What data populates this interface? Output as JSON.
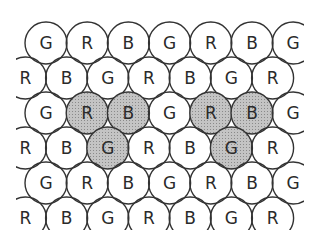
{
  "diagram": {
    "fill_plain": "#ffffff",
    "fill_highlight": "#b8b8b8",
    "stroke": "#333333",
    "rows": [
      {
        "offset": 0,
        "cells": [
          {
            "label": "G"
          },
          {
            "label": "R"
          },
          {
            "label": "B"
          },
          {
            "label": "G"
          },
          {
            "label": "R"
          },
          {
            "label": "B"
          },
          {
            "label": "G"
          }
        ]
      },
      {
        "offset": 1,
        "cells": [
          {
            "label": "R"
          },
          {
            "label": "B"
          },
          {
            "label": "G"
          },
          {
            "label": "R"
          },
          {
            "label": "B"
          },
          {
            "label": "G"
          },
          {
            "label": "R"
          }
        ]
      },
      {
        "offset": 0,
        "cells": [
          {
            "label": "G"
          },
          {
            "label": "R",
            "highlight": true
          },
          {
            "label": "B",
            "highlight": true
          },
          {
            "label": "G"
          },
          {
            "label": "R",
            "highlight": true
          },
          {
            "label": "B",
            "highlight": true
          },
          {
            "label": "G"
          }
        ]
      },
      {
        "offset": 1,
        "cells": [
          {
            "label": "R"
          },
          {
            "label": "B"
          },
          {
            "label": "G",
            "highlight": true
          },
          {
            "label": "R"
          },
          {
            "label": "B"
          },
          {
            "label": "G",
            "highlight": true
          },
          {
            "label": "R"
          }
        ]
      },
      {
        "offset": 0,
        "cells": [
          {
            "label": "G"
          },
          {
            "label": "R"
          },
          {
            "label": "B"
          },
          {
            "label": "G"
          },
          {
            "label": "R"
          },
          {
            "label": "B"
          },
          {
            "label": "G"
          }
        ]
      },
      {
        "offset": 1,
        "cells": [
          {
            "label": "R"
          },
          {
            "label": "B"
          },
          {
            "label": "G"
          },
          {
            "label": "R"
          },
          {
            "label": "B"
          },
          {
            "label": "G"
          },
          {
            "label": "R"
          }
        ]
      }
    ]
  }
}
